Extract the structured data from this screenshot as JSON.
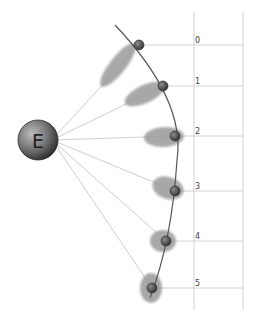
{
  "diagram": {
    "central_body": {
      "label": "E",
      "cx": 38,
      "cy": 140,
      "r": 20
    },
    "orbit_arc": {
      "path": "M115,25 Q186,100 177,160 Q172,240 150,298"
    },
    "guide_lines": {
      "x_left": 194,
      "x_right": 243,
      "y_top": 12,
      "y_bottom": 310
    },
    "positions": [
      {
        "label": "0",
        "x": 139,
        "y": 45,
        "ell_cx": 118,
        "ell_cy": 65,
        "ell_rx": 27,
        "ell_ry": 8,
        "ell_rot": -52
      },
      {
        "label": "1",
        "x": 163,
        "y": 86,
        "ell_cx": 145,
        "ell_cy": 94,
        "ell_rx": 22,
        "ell_ry": 9,
        "ell_rot": -25
      },
      {
        "label": "2",
        "x": 175,
        "y": 136,
        "ell_cx": 164,
        "ell_cy": 137,
        "ell_rx": 20,
        "ell_ry": 10,
        "ell_rot": -3
      },
      {
        "label": "3",
        "x": 175,
        "y": 191,
        "ell_cx": 168,
        "ell_cy": 188,
        "ell_rx": 16,
        "ell_ry": 11,
        "ell_rot": 18
      },
      {
        "label": "4",
        "x": 166,
        "y": 241,
        "ell_cx": 163,
        "ell_cy": 241,
        "ell_rx": 13,
        "ell_ry": 11,
        "ell_rot": 0
      },
      {
        "label": "5",
        "x": 152,
        "y": 288,
        "ell_cx": 151,
        "ell_cy": 288,
        "ell_rx": 11,
        "ell_ry": 15,
        "ell_rot": 0
      }
    ],
    "colors": {
      "ray": "#c8c8c8",
      "guide": "#d2d2d2",
      "arc": "#555555",
      "ellipse": "#9a9a9a",
      "dot_dark": "#3a3a3a",
      "dot_light": "#8a8a8a",
      "earth_dark": "#333333",
      "earth_light": "#b8b8b8"
    }
  }
}
